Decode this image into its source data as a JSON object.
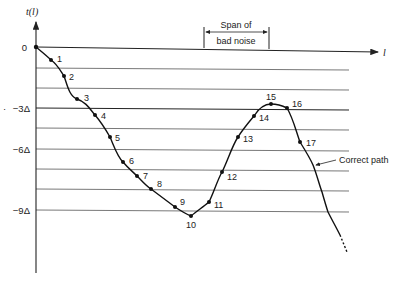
{
  "diagram": {
    "y_axis_label": "t(l)",
    "x_axis_label": "l",
    "y_ticks": [
      {
        "label": "0",
        "y": 47
      },
      {
        "label": "−3Δ",
        "y": 108
      },
      {
        "label": "−6Δ",
        "y": 149
      },
      {
        "label": "−9Δ",
        "y": 210
      }
    ],
    "grid_lines_y": [
      47,
      68,
      88,
      108,
      128,
      149,
      169,
      189,
      210
    ],
    "span_annotation": {
      "line1": "Span of",
      "line2": "bad noise"
    },
    "path_label": "Correct path",
    "nodes": [
      {
        "label": "0",
        "x": 36,
        "y": 47
      },
      {
        "label": "1",
        "x": 51,
        "y": 60
      },
      {
        "label": "2",
        "x": 64,
        "y": 76
      },
      {
        "label": "3",
        "x": 77,
        "y": 99
      },
      {
        "label": "4",
        "x": 95,
        "y": 115
      },
      {
        "label": "5",
        "x": 110,
        "y": 137
      },
      {
        "label": "6",
        "x": 123,
        "y": 162
      },
      {
        "label": "7",
        "x": 137,
        "y": 176
      },
      {
        "label": "8",
        "x": 151,
        "y": 189
      },
      {
        "label": "9",
        "x": 175,
        "y": 207
      },
      {
        "label": "10",
        "x": 191,
        "y": 216
      },
      {
        "label": "11",
        "x": 209,
        "y": 202
      },
      {
        "label": "12",
        "x": 222,
        "y": 172
      },
      {
        "label": "13",
        "x": 238,
        "y": 137
      },
      {
        "label": "14",
        "x": 254,
        "y": 116
      },
      {
        "label": "15",
        "x": 271,
        "y": 104
      },
      {
        "label": "16",
        "x": 287,
        "y": 108
      },
      {
        "label": "17",
        "x": 300,
        "y": 142
      }
    ]
  }
}
